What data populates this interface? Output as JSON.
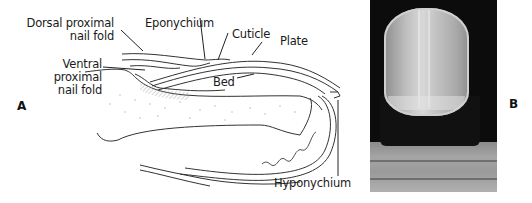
{
  "figure": {
    "panel_a": {
      "letter": "A",
      "labels": {
        "dorsal_proximal_nail_fold": [
          "Dorsal proximal",
          "nail fold"
        ],
        "eponychium": "Eponychium",
        "cuticle": "Cuticle",
        "plate": "Plate",
        "ventral_proximal_nail_fold": [
          "Ventral",
          "proximal",
          "nail fold"
        ],
        "bed": "Bed",
        "hyponychium": "Hyponychium"
      }
    },
    "panel_b": {
      "letter": "B",
      "content": "photograph-of-fingernail"
    }
  }
}
